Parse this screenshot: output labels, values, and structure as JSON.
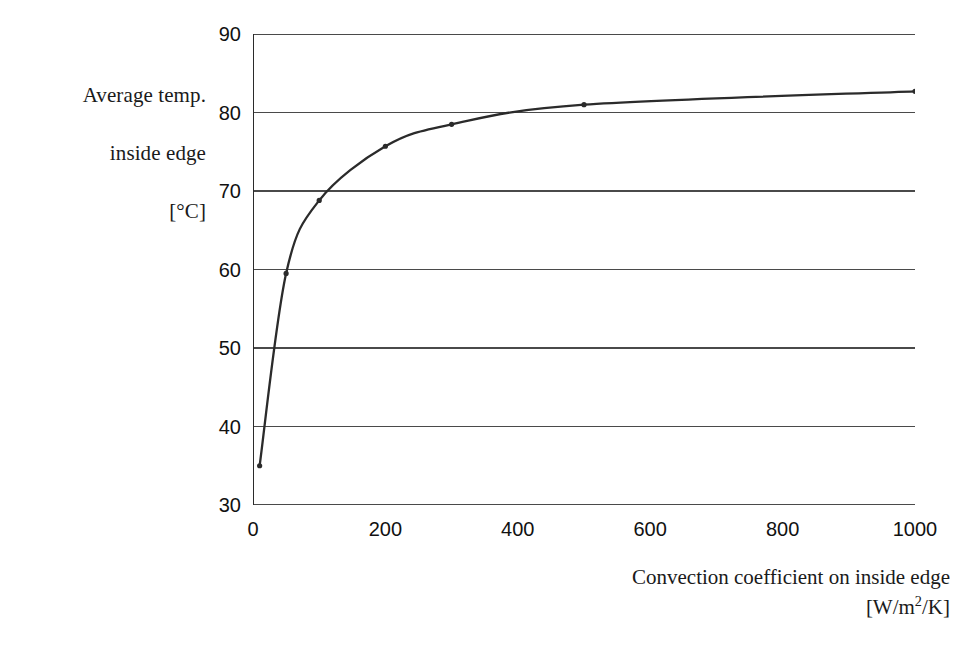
{
  "chart_data": {
    "type": "line",
    "title": "",
    "xlabel": "Convection coefficient on inside edge [W/m2/K]",
    "ylabel": "Average temp. inside edge [°C]",
    "xlim": [
      0,
      1000
    ],
    "ylim": [
      30,
      90
    ],
    "xticks": [
      0,
      200,
      400,
      600,
      800,
      1000
    ],
    "yticks": [
      30,
      40,
      50,
      60,
      70,
      80,
      90
    ],
    "grid": "horizontal",
    "legend": "none",
    "series": [
      {
        "name": "Average temp. inside edge",
        "marker": "dot",
        "color": "#2b2b2b",
        "x": [
          10,
          50,
          100,
          200,
          300,
          500,
          1000
        ],
        "y": [
          35.0,
          59.5,
          68.8,
          75.7,
          78.5,
          81.0,
          82.7
        ]
      }
    ]
  },
  "axes": {
    "y_title_lines": [
      "Average temp.",
      "inside edge"
    ],
    "y_title_unit": "[°C]",
    "x_title_main": "Convection coefficient on inside edge",
    "x_title_unit_prefix": "[W/m",
    "x_title_unit_sup": "2",
    "x_title_unit_suffix": "/K]",
    "ytick_labels": [
      "90",
      "80",
      "70",
      "60",
      "50",
      "40",
      "30"
    ],
    "xtick_labels": [
      "0",
      "200",
      "400",
      "600",
      "800",
      "1000"
    ]
  },
  "colors": {
    "curve": "#2b2b2b",
    "gridline": "#4a4a4a",
    "axis": "#2b2b2b",
    "background": "#ffffff",
    "text": "#1a1a1a"
  }
}
